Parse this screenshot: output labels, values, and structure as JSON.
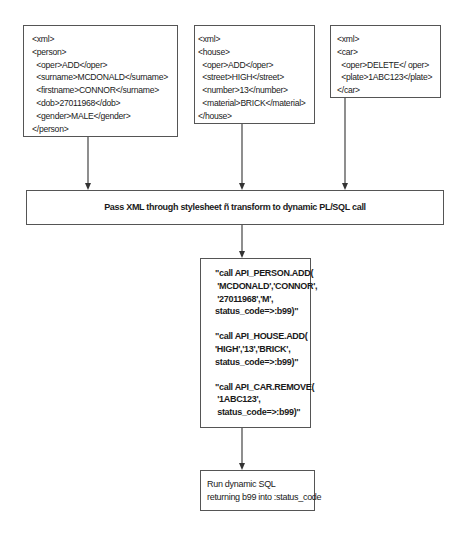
{
  "diagram": {
    "xml_inputs": [
      {
        "id": "person",
        "lines": [
          "<xml>",
          "<person>",
          "  <oper>ADD</oper>",
          "  <surname>MCDONALD</surname>",
          "  <firstname>CONNOR</surname>",
          "  <dob>27011968</dob>",
          "  <gender>MALE</gender>",
          "</person>"
        ]
      },
      {
        "id": "house",
        "lines": [
          "<xml>",
          "<house>",
          "  <oper>ADD</oper>",
          "  <street>HIGH</street>",
          "  <number>13</number>",
          "  <material>BRICK</material>",
          "</house>"
        ]
      },
      {
        "id": "car",
        "lines": [
          "<xml>",
          "<car>",
          "  <oper>DELETE</ oper>",
          "  <plate>1ABC123</plate>",
          "</car>"
        ]
      }
    ],
    "transform_step": "Pass XML through stylesheet ñ transform to dynamic PL/SQL call",
    "dynamic_calls": [
      {
        "lines": [
          "\"call API_PERSON.ADD(",
          " 'MCDONALD','CONNOR',",
          " '27011968','M',",
          "status_code=>:b99)\""
        ]
      },
      {
        "lines": [
          "\"call API_HOUSE.ADD(",
          "'HIGH','13','BRICK',",
          "status_code=>:b99)\""
        ]
      },
      {
        "lines": [
          "\"call API_CAR.REMOVE(",
          " '1ABC123',",
          " status_code=>:b99)\""
        ]
      }
    ],
    "run_step": {
      "lines": [
        "Run dynamic SQL",
        "returning b99 into :status_code"
      ]
    },
    "colors": {
      "line": "#444444",
      "border": "#555555",
      "text": "#1a1a1a",
      "background": "#ffffff"
    }
  }
}
